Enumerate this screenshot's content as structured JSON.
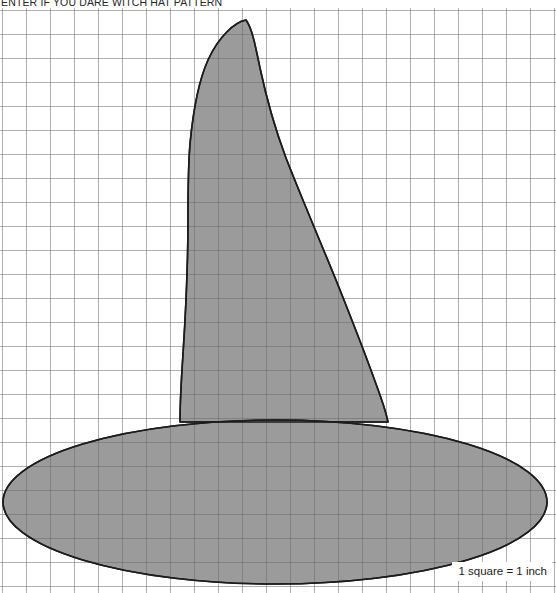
{
  "document": {
    "title": "ENTER IF YOU DARE WITCH HAT PATTERN",
    "scale_note": "1 square = 1 inch"
  },
  "page": {
    "width": 556,
    "height": 593,
    "background_color": "#ffffff"
  },
  "grid": {
    "cell_size_px": 24,
    "columns": 23,
    "rows": 24,
    "origin_x": 2,
    "origin_y": 2,
    "line_color": "#595959",
    "line_color_light": "#8c8c8c",
    "line_width": 1,
    "unit_label": "1 inch"
  },
  "pattern": {
    "name": "witch-hat",
    "fill_color": "#9b9b9b",
    "stroke_color": "#1c1c1c",
    "stroke_width": 1.6,
    "cone": {
      "apex_x": 246,
      "apex_y": 12,
      "base_left_x": 180,
      "base_right_x": 388,
      "base_y": 414,
      "description": "tall curved witch hat cone leaning left at the tip"
    },
    "brim": {
      "center_x": 275,
      "center_y": 494,
      "radius_x": 272,
      "radius_y": 82,
      "description": "wide flat elliptical brim"
    }
  },
  "colors": {
    "paper": "#ffffff",
    "ink": "#1c1c1c",
    "shape_gray": "#9b9b9b",
    "grid_gray": "#595959"
  }
}
